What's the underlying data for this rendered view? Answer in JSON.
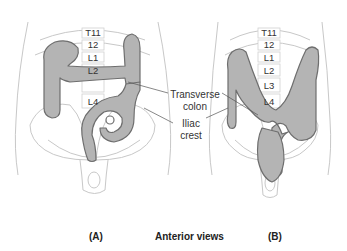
{
  "figure": {
    "panels": [
      {
        "id": "A",
        "label": "(A)",
        "vertebrae": [
          "T11",
          "12",
          "L1",
          "L2",
          "L4"
        ]
      },
      {
        "id": "B",
        "label": "(B)",
        "vertebrae": [
          "T11",
          "12",
          "L1",
          "L2",
          "L3",
          "L4"
        ]
      }
    ],
    "callouts": {
      "transverse_colon": "Transverse colon",
      "transverse_line1": "Transverse",
      "transverse_line2": "colon",
      "iliac_line1": "Iliac",
      "iliac_line2": "crest"
    },
    "caption": "Anterior views",
    "colors": {
      "colon_fill": "#b4b4b4",
      "colon_outline": "#6e6e6e",
      "body_outline": "#c8c8c8",
      "text": "#333333"
    }
  }
}
